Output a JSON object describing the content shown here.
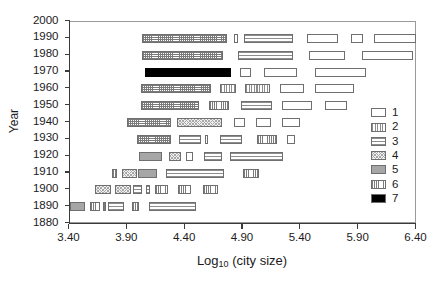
{
  "chart_data": {
    "type": "bar",
    "title": "",
    "subtitle": "",
    "xlabel": "Log10 (city size)",
    "xlabel_base": "Log",
    "xlabel_sub": "10",
    "xlabel_rest": " (city size)",
    "ylabel": "Year",
    "xlim": [
      3.4,
      6.4
    ],
    "ylim": [
      1880,
      2000
    ],
    "xticks": [
      3.4,
      3.9,
      4.4,
      4.9,
      5.4,
      5.9,
      6.4
    ],
    "xtick_labels": [
      "3.40",
      "3.90",
      "4.40",
      "4.90",
      "5.40",
      "5.90",
      "6.40"
    ],
    "yticks": [
      1880,
      1890,
      1900,
      1910,
      1920,
      1930,
      1940,
      1950,
      1960,
      1970,
      1980,
      1990,
      2000
    ],
    "ytick_labels": [
      "1880",
      "1890",
      "1900",
      "1910",
      "1920",
      "1930",
      "1940",
      "1950",
      "1960",
      "1970",
      "1980",
      "1990",
      "2000"
    ],
    "grid": false,
    "orientation": "horizontal-interval-bars",
    "legend_position": "right-inside",
    "legend_title": "",
    "legend": [
      {
        "key": "1",
        "label": "1",
        "pattern": "empty"
      },
      {
        "key": "2",
        "label": "2",
        "pattern": "vertical-stripes"
      },
      {
        "key": "3",
        "label": "3",
        "pattern": "horizontal-stripes"
      },
      {
        "key": "4",
        "label": "4",
        "pattern": "stipple"
      },
      {
        "key": "5",
        "label": "5",
        "pattern": "solid-gray"
      },
      {
        "key": "6",
        "label": "6",
        "pattern": "fine-vertical-grid"
      },
      {
        "key": "7",
        "label": "7",
        "pattern": "solid-black"
      }
    ],
    "rows": [
      {
        "year": 1990,
        "bars": [
          {
            "x0": 4.03,
            "x1": 4.76,
            "pattern": "grid"
          },
          {
            "x0": 4.82,
            "x1": 4.86,
            "pattern": "1"
          },
          {
            "x0": 4.91,
            "x1": 5.33,
            "pattern": "3"
          },
          {
            "x0": 5.45,
            "x1": 5.72,
            "pattern": "1"
          },
          {
            "x0": 5.83,
            "x1": 5.94,
            "pattern": "1"
          },
          {
            "x0": 6.03,
            "x1": 6.4,
            "pattern": "1"
          }
        ]
      },
      {
        "year": 1980,
        "bars": [
          {
            "x0": 4.03,
            "x1": 4.73,
            "pattern": "grid"
          },
          {
            "x0": 4.86,
            "x1": 5.33,
            "pattern": "3"
          },
          {
            "x0": 5.47,
            "x1": 5.78,
            "pattern": "1"
          },
          {
            "x0": 5.93,
            "x1": 6.37,
            "pattern": "1"
          }
        ]
      },
      {
        "year": 1970,
        "bars": [
          {
            "x0": 4.05,
            "x1": 4.8,
            "pattern": "7"
          },
          {
            "x0": 4.87,
            "x1": 4.97,
            "pattern": "1"
          },
          {
            "x0": 5.08,
            "x1": 5.37,
            "pattern": "1"
          },
          {
            "x0": 5.52,
            "x1": 5.96,
            "pattern": "1"
          }
        ]
      },
      {
        "year": 1960,
        "bars": [
          {
            "x0": 4.02,
            "x1": 4.62,
            "pattern": "grid"
          },
          {
            "x0": 4.7,
            "x1": 4.84,
            "pattern": "2"
          },
          {
            "x0": 4.92,
            "x1": 5.13,
            "pattern": "2"
          },
          {
            "x0": 5.22,
            "x1": 5.43,
            "pattern": "1"
          },
          {
            "x0": 5.52,
            "x1": 5.86,
            "pattern": "1"
          }
        ]
      },
      {
        "year": 1950,
        "bars": [
          {
            "x0": 4.02,
            "x1": 4.52,
            "pattern": "grid"
          },
          {
            "x0": 4.61,
            "x1": 4.78,
            "pattern": "6"
          },
          {
            "x0": 4.88,
            "x1": 5.15,
            "pattern": "3"
          },
          {
            "x0": 5.24,
            "x1": 5.5,
            "pattern": "1"
          },
          {
            "x0": 5.61,
            "x1": 5.8,
            "pattern": "1"
          }
        ]
      },
      {
        "year": 1940,
        "bars": [
          {
            "x0": 3.9,
            "x1": 4.28,
            "pattern": "grid"
          },
          {
            "x0": 4.33,
            "x1": 4.72,
            "pattern": "4"
          },
          {
            "x0": 4.82,
            "x1": 4.92,
            "pattern": "1"
          },
          {
            "x0": 5.01,
            "x1": 5.14,
            "pattern": "1"
          },
          {
            "x0": 5.24,
            "x1": 5.39,
            "pattern": "1"
          }
        ]
      },
      {
        "year": 1930,
        "bars": [
          {
            "x0": 3.98,
            "x1": 4.28,
            "pattern": "grid"
          },
          {
            "x0": 4.35,
            "x1": 4.54,
            "pattern": "3"
          },
          {
            "x0": 4.57,
            "x1": 4.6,
            "pattern": "1"
          },
          {
            "x0": 4.7,
            "x1": 4.89,
            "pattern": "3"
          },
          {
            "x0": 5.02,
            "x1": 5.19,
            "pattern": "6"
          },
          {
            "x0": 5.28,
            "x1": 5.35,
            "pattern": "1"
          }
        ]
      },
      {
        "year": 1920,
        "bars": [
          {
            "x0": 4.0,
            "x1": 4.2,
            "pattern": "5"
          },
          {
            "x0": 4.26,
            "x1": 4.36,
            "pattern": "4"
          },
          {
            "x0": 4.41,
            "x1": 4.47,
            "pattern": "1"
          },
          {
            "x0": 4.56,
            "x1": 4.72,
            "pattern": "3"
          },
          {
            "x0": 4.79,
            "x1": 5.25,
            "pattern": "3"
          }
        ]
      },
      {
        "year": 1910,
        "bars": [
          {
            "x0": 3.77,
            "x1": 3.81,
            "pattern": "6"
          },
          {
            "x0": 3.85,
            "x1": 3.98,
            "pattern": "4"
          },
          {
            "x0": 3.99,
            "x1": 4.16,
            "pattern": "5"
          },
          {
            "x0": 4.23,
            "x1": 4.74,
            "pattern": "3"
          },
          {
            "x0": 4.9,
            "x1": 5.04,
            "pattern": "6"
          }
        ]
      },
      {
        "year": 1900,
        "bars": [
          {
            "x0": 3.62,
            "x1": 3.76,
            "pattern": "4"
          },
          {
            "x0": 3.79,
            "x1": 3.93,
            "pattern": "4"
          },
          {
            "x0": 3.95,
            "x1": 4.03,
            "pattern": "3"
          },
          {
            "x0": 4.06,
            "x1": 4.1,
            "pattern": "3"
          },
          {
            "x0": 4.14,
            "x1": 4.25,
            "pattern": "6"
          },
          {
            "x0": 4.34,
            "x1": 4.45,
            "pattern": "6"
          },
          {
            "x0": 4.55,
            "x1": 4.68,
            "pattern": "6"
          }
        ]
      },
      {
        "year": 1890,
        "bars": [
          {
            "x0": 3.4,
            "x1": 3.53,
            "pattern": "5"
          },
          {
            "x0": 3.58,
            "x1": 3.66,
            "pattern": "6"
          },
          {
            "x0": 3.69,
            "x1": 3.71,
            "pattern": "6"
          },
          {
            "x0": 3.73,
            "x1": 3.87,
            "pattern": "3"
          },
          {
            "x0": 3.94,
            "x1": 4.0,
            "pattern": "6"
          },
          {
            "x0": 4.09,
            "x1": 4.49,
            "pattern": "3"
          }
        ]
      }
    ]
  }
}
